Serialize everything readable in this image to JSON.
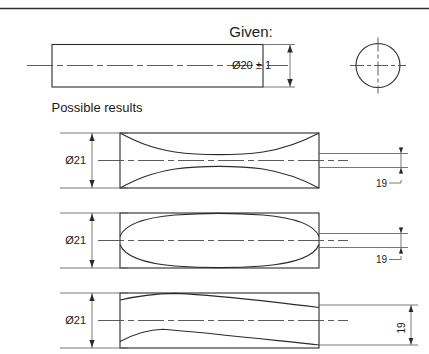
{
  "drawing": {
    "title": "Given:",
    "subtitle": "Possible results",
    "given": {
      "dimension_label": "Ø20 ± 1",
      "diameter_value": 20,
      "tolerance": 1,
      "bar_view_name": "rectangular-side-view",
      "end_view_name": "circular-end-view"
    },
    "results": [
      {
        "id": "result-1",
        "form": "hourglass",
        "max_label": "Ø21",
        "min_label": "19",
        "max_value": 21,
        "min_value": 19
      },
      {
        "id": "result-2",
        "form": "barrel",
        "max_label": "Ø21",
        "min_label": "19",
        "max_value": 21,
        "min_value": 19
      },
      {
        "id": "result-3",
        "form": "tapered",
        "max_label": "Ø21",
        "min_label": "19",
        "max_value": 21,
        "min_value": 19
      }
    ],
    "colors": {
      "line": "#2b2b2b",
      "thin_line": "#555555",
      "center_line": "#4a4a4a",
      "text": "#1a1a1a",
      "background": "#ffffff"
    }
  }
}
